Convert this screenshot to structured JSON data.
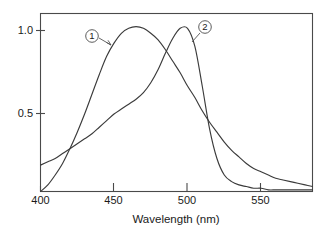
{
  "chart_data": {
    "type": "line",
    "title": "",
    "subtitle": "",
    "xlabel": "Wavelength (nm)",
    "ylabel": "",
    "xlim": [
      400,
      585
    ],
    "ylim": [
      0,
      1.08
    ],
    "grid": false,
    "legend_position": "inline-callouts",
    "xticks": [
      400,
      450,
      500,
      550
    ],
    "xtick_labels": [
      "400",
      "450",
      "500",
      "550"
    ],
    "yticks": [
      0.5,
      1.0
    ],
    "ytick_labels": [
      "0.5",
      "1.0"
    ],
    "annotations": [
      {
        "label": "1",
        "style": "circled-number",
        "points_to_series": "1"
      },
      {
        "label": "2",
        "style": "circled-number",
        "points_to_series": "2"
      }
    ],
    "series": [
      {
        "name": "1",
        "label": "1",
        "color": "#3b3b3b",
        "peak_x": 462,
        "peak_y": 1.0,
        "x": [
          400,
          405,
          410,
          415,
          420,
          425,
          430,
          435,
          440,
          445,
          450,
          455,
          460,
          465,
          470,
          475,
          480,
          485,
          490,
          495,
          500,
          505,
          510,
          515,
          520,
          525,
          530,
          535,
          540,
          545,
          550,
          555,
          560,
          565,
          570,
          575,
          580,
          585
        ],
        "values": [
          0.0,
          0.04,
          0.1,
          0.17,
          0.26,
          0.36,
          0.47,
          0.59,
          0.71,
          0.82,
          0.9,
          0.96,
          0.99,
          1.0,
          0.99,
          0.96,
          0.92,
          0.86,
          0.79,
          0.72,
          0.64,
          0.57,
          0.49,
          0.42,
          0.36,
          0.3,
          0.25,
          0.21,
          0.17,
          0.14,
          0.12,
          0.1,
          0.08,
          0.07,
          0.06,
          0.05,
          0.04,
          0.03
        ]
      },
      {
        "name": "2",
        "label": "2",
        "color": "#3b3b3b",
        "peak_x": 496,
        "peak_y": 1.0,
        "x": [
          400,
          405,
          410,
          415,
          420,
          425,
          430,
          435,
          440,
          445,
          450,
          455,
          460,
          465,
          470,
          475,
          480,
          485,
          490,
          495,
          500,
          505,
          510,
          515,
          520,
          525,
          530,
          535,
          540,
          545,
          550,
          555,
          560,
          565,
          570,
          575,
          580,
          585
        ],
        "values": [
          0.16,
          0.18,
          0.2,
          0.23,
          0.26,
          0.29,
          0.32,
          0.35,
          0.39,
          0.43,
          0.47,
          0.5,
          0.53,
          0.56,
          0.6,
          0.66,
          0.74,
          0.84,
          0.93,
          0.99,
          0.99,
          0.88,
          0.64,
          0.38,
          0.2,
          0.1,
          0.06,
          0.04,
          0.03,
          0.02,
          0.02,
          0.01,
          0.01,
          0.01,
          0.01,
          0.01,
          0.01,
          0.01
        ]
      }
    ]
  }
}
